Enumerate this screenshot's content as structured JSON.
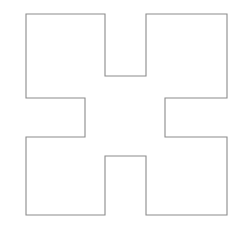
{
  "figure": {
    "name": "cross-polygon",
    "background_color": "#ffffff",
    "stroke_color": "#8b8b8b",
    "fill_color": "#ffffff",
    "stroke_width": 1.1,
    "canvas": {
      "width": 237,
      "height": 244
    },
    "bounding_box": {
      "x": 26,
      "y": 14,
      "width": 201,
      "height": 201
    },
    "vertex_count": 12,
    "vertices": [
      {
        "id": "top-left-corner",
        "x": 26,
        "y": 14
      },
      {
        "id": "top-notch-left-top",
        "x": 105,
        "y": 14
      },
      {
        "id": "top-notch-left-bottom",
        "x": 105,
        "y": 76
      },
      {
        "id": "top-notch-right-bottom",
        "x": 146,
        "y": 76
      },
      {
        "id": "top-notch-right-top",
        "x": 146,
        "y": 14
      },
      {
        "id": "top-right-corner",
        "x": 227,
        "y": 14
      },
      {
        "id": "right-notch-top-right",
        "x": 227,
        "y": 98
      },
      {
        "id": "right-notch-top-left",
        "x": 165,
        "y": 98
      },
      {
        "id": "right-notch-bottom-left",
        "x": 165,
        "y": 137
      },
      {
        "id": "right-notch-bottom-right",
        "x": 227,
        "y": 137
      },
      {
        "id": "bottom-right-corner",
        "x": 227,
        "y": 215
      },
      {
        "id": "bottom-notch-right-bottom",
        "x": 146,
        "y": 215
      },
      {
        "id": "bottom-notch-right-top",
        "x": 146,
        "y": 156
      },
      {
        "id": "bottom-notch-left-top",
        "x": 105,
        "y": 156
      },
      {
        "id": "bottom-notch-left-bottom",
        "x": 105,
        "y": 215
      },
      {
        "id": "bottom-left-corner",
        "x": 26,
        "y": 215
      },
      {
        "id": "left-notch-bottom-left",
        "x": 26,
        "y": 137
      },
      {
        "id": "left-notch-bottom-right",
        "x": 85,
        "y": 137
      },
      {
        "id": "left-notch-top-right",
        "x": 85,
        "y": 98
      },
      {
        "id": "left-notch-top-left",
        "x": 26,
        "y": 98
      }
    ],
    "path": "M 26,14 L 105,14 L 105,76 L 146,76 L 146,14 L 227,14 L 227,98 L 165,98 L 165,137 L 227,137 L 227,215 L 146,215 L 146,156 L 105,156 L 105,215 L 26,215 L 26,137 L 85,137 L 85,98 L 26,98 Z",
    "notches": [
      {
        "side": "top",
        "label": "top-notch",
        "x": 105,
        "y": 14,
        "width": 41,
        "height": 62
      },
      {
        "side": "right",
        "label": "right-notch",
        "x": 165,
        "y": 98,
        "width": 62,
        "height": 39
      },
      {
        "side": "bottom",
        "label": "bottom-notch",
        "x": 105,
        "y": 156,
        "width": 41,
        "height": 59
      },
      {
        "side": "left",
        "label": "left-notch",
        "x": 26,
        "y": 98,
        "width": 59,
        "height": 39
      }
    ]
  }
}
